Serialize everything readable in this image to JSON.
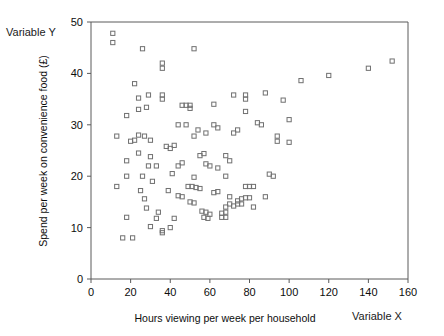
{
  "annotations": {
    "variable_y": "Variable Y",
    "variable_x": "Variable X"
  },
  "chart_data": {
    "type": "scatter",
    "title": "",
    "xlabel": "Hours viewing per week per household",
    "ylabel": "Spend per week on convenience food (£)",
    "xlim": [
      0,
      160
    ],
    "ylim": [
      0,
      50
    ],
    "xticks": [
      0,
      20,
      40,
      60,
      80,
      100,
      120,
      140,
      160
    ],
    "yticks": [
      0,
      10,
      20,
      30,
      40,
      50
    ],
    "grid": false,
    "legend": false,
    "marker": "open-square",
    "marker_color": "#707070",
    "series": [
      {
        "name": "households",
        "points": [
          [
            11,
            47.8
          ],
          [
            11,
            46.0
          ],
          [
            26,
            44.8
          ],
          [
            52,
            44.8
          ],
          [
            36,
            42.0
          ],
          [
            36,
            41.0
          ],
          [
            22,
            38.0
          ],
          [
            24,
            35.2
          ],
          [
            29,
            35.8
          ],
          [
            36,
            35.8
          ],
          [
            36,
            35.0
          ],
          [
            72,
            35.8
          ],
          [
            78,
            35.8
          ],
          [
            78,
            35.0
          ],
          [
            24,
            33.0
          ],
          [
            28,
            33.4
          ],
          [
            62,
            34.0
          ],
          [
            46,
            33.8
          ],
          [
            48,
            33.8
          ],
          [
            50,
            33.8
          ],
          [
            50,
            33.2
          ],
          [
            18,
            31.8
          ],
          [
            78,
            32.6
          ],
          [
            44,
            30.0
          ],
          [
            48,
            30.0
          ],
          [
            88,
            36.2
          ],
          [
            97,
            34.8
          ],
          [
            13,
            27.8
          ],
          [
            52,
            27.8
          ],
          [
            27,
            27.8
          ],
          [
            20,
            26.8
          ],
          [
            22,
            27.0
          ],
          [
            42,
            26.0
          ],
          [
            94,
            27.8
          ],
          [
            18,
            23.0
          ],
          [
            24,
            24.5
          ],
          [
            30,
            23.8
          ],
          [
            68,
            24.0
          ],
          [
            70,
            23.0
          ],
          [
            94,
            26.8
          ],
          [
            100,
            26.6
          ],
          [
            13,
            18.0
          ],
          [
            18,
            20.0
          ],
          [
            26,
            20.0
          ],
          [
            31,
            19.0
          ],
          [
            41,
            20.5
          ],
          [
            52,
            19.8
          ],
          [
            68,
            20.0
          ],
          [
            90,
            20.4
          ],
          [
            92,
            20.0
          ],
          [
            25,
            17.2
          ],
          [
            39,
            17.2
          ],
          [
            49,
            18.0
          ],
          [
            51,
            18.0
          ],
          [
            78,
            18.0
          ],
          [
            80,
            18.0
          ],
          [
            82,
            18.0
          ],
          [
            27,
            15.6
          ],
          [
            70,
            16.0
          ],
          [
            74,
            15.2
          ],
          [
            76,
            15.6
          ],
          [
            78,
            15.8
          ],
          [
            80,
            15.8
          ],
          [
            88,
            16.0
          ],
          [
            28,
            13.8
          ],
          [
            68,
            14.0
          ],
          [
            70,
            14.6
          ],
          [
            72,
            14.2
          ],
          [
            74,
            14.6
          ],
          [
            76,
            14.6
          ],
          [
            82,
            14.0
          ],
          [
            18,
            12.0
          ],
          [
            33,
            11.8
          ],
          [
            42,
            11.8
          ],
          [
            66,
            12.8
          ],
          [
            68,
            13.0
          ],
          [
            66,
            12.0
          ],
          [
            68,
            12.0
          ],
          [
            30,
            10.2
          ],
          [
            36,
            9.4
          ],
          [
            36,
            9.0
          ],
          [
            40,
            10.0
          ],
          [
            16,
            8.0
          ],
          [
            21,
            8.0
          ],
          [
            120,
            39.6
          ],
          [
            152,
            42.4
          ],
          [
            140,
            41.0
          ],
          [
            106,
            38.6
          ],
          [
            58,
            22.4
          ],
          [
            60,
            22.0
          ],
          [
            64,
            21.6
          ],
          [
            46,
            22.6
          ],
          [
            44,
            22.0
          ],
          [
            33,
            22.0
          ],
          [
            29,
            22.0
          ],
          [
            55,
            24.0
          ],
          [
            57,
            24.4
          ],
          [
            54,
            29.0
          ],
          [
            58,
            28.4
          ],
          [
            62,
            30.0
          ],
          [
            64,
            29.4
          ],
          [
            72,
            28.4
          ],
          [
            74,
            29.0
          ],
          [
            84,
            30.4
          ],
          [
            86,
            30.0
          ],
          [
            100,
            31.0
          ],
          [
            44,
            16.2
          ],
          [
            46,
            16.0
          ],
          [
            34,
            13.0
          ],
          [
            50,
            15.0
          ],
          [
            52,
            14.8
          ],
          [
            56,
            13.2
          ],
          [
            58,
            13.0
          ],
          [
            60,
            12.6
          ],
          [
            62,
            16.8
          ],
          [
            64,
            17.0
          ],
          [
            53,
            17.8
          ],
          [
            55,
            17.6
          ],
          [
            57,
            12.0
          ],
          [
            59,
            11.8
          ],
          [
            24,
            28.0
          ],
          [
            30,
            27.0
          ],
          [
            38,
            25.8
          ],
          [
            40,
            25.4
          ]
        ]
      }
    ]
  }
}
